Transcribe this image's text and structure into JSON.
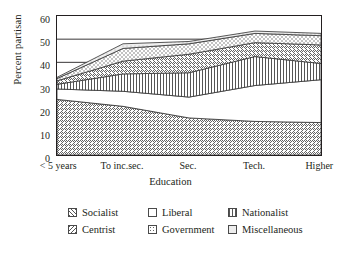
{
  "chart_data": {
    "type": "area",
    "stacked": true,
    "title": "",
    "xlabel": "Education",
    "ylabel": "Percent partisan",
    "categories": [
      "< 5 years",
      "To inc.sec.",
      "Sec.",
      "Tech.",
      "Higher"
    ],
    "ylim": [
      0,
      60
    ],
    "yticks": [
      0,
      10,
      20,
      30,
      40,
      50,
      60
    ],
    "grid": "horizontal-gridlines-at-40-50-60",
    "legend_position": "below",
    "series": [
      {
        "name": "Socialist",
        "pattern": "diagonal-up-hatch",
        "values": [
          24.0,
          21.0,
          16.0,
          14.5,
          14.0
        ]
      },
      {
        "name": "Liberal",
        "pattern": "solid-white",
        "values": [
          4.5,
          6.5,
          9.0,
          15.5,
          18.5
        ]
      },
      {
        "name": "Nationalist",
        "pattern": "vertical-lines",
        "values": [
          2.0,
          7.5,
          10.5,
          12.5,
          7.0
        ]
      },
      {
        "name": "Centrist",
        "pattern": "diagonal-down-hatch",
        "values": [
          1.5,
          5.5,
          8.0,
          6.0,
          8.0
        ]
      },
      {
        "name": "Government",
        "pattern": "dotted-crosshatch",
        "values": [
          1.0,
          5.5,
          4.5,
          4.0,
          4.0
        ]
      },
      {
        "name": "Miscellaneous",
        "pattern": "faint-light",
        "values": [
          0.5,
          2.0,
          1.0,
          1.0,
          1.0
        ]
      }
    ],
    "cumulative_top_line": [
      33.5,
      48.0,
      49.0,
      53.5,
      52.5
    ],
    "boundaries": {
      "socialist_top": [
        24.0,
        21.0,
        16.0,
        14.5,
        14.0
      ],
      "liberal_top": [
        28.5,
        27.5,
        25.0,
        30.0,
        32.5
      ],
      "nationalist_top": [
        30.5,
        35.0,
        35.5,
        42.5,
        39.5
      ],
      "centrist_top": [
        32.0,
        40.5,
        43.5,
        48.5,
        47.5
      ],
      "government_top": [
        33.0,
        46.0,
        48.0,
        52.5,
        51.5
      ],
      "miscellaneous_top": [
        33.5,
        48.0,
        49.0,
        53.5,
        52.5
      ]
    }
  },
  "axes": {
    "y_title": "Percent partisan",
    "x_title": "Education",
    "y_tick_labels": [
      "60",
      "50",
      "40",
      "30",
      "20",
      "10",
      "0"
    ],
    "x_tick_labels": [
      "< 5 years",
      "To inc.sec.",
      "Sec.",
      "Tech.",
      "Higher"
    ]
  },
  "legend": {
    "row1": [
      {
        "label": "Socialist",
        "swatch": "diagonal-up-hatch-swatch"
      },
      {
        "label": "Liberal",
        "swatch": "white-swatch"
      },
      {
        "label": "Nationalist",
        "swatch": "vertical-lines-swatch"
      }
    ],
    "row2": [
      {
        "label": "Centrist",
        "swatch": "diagonal-down-hatch-swatch"
      },
      {
        "label": "Government",
        "swatch": "dotted-crosshatch-swatch"
      },
      {
        "label": "Miscellaneous",
        "swatch": "faint-light-swatch"
      }
    ]
  },
  "colors": {
    "ink": "#231f20",
    "line": "#4a4a4a",
    "background": "#ffffff"
  }
}
